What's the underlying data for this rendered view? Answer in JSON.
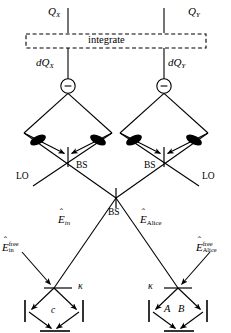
{
  "figure": {
    "background_color": "#ffffff",
    "line_color": "#000000",
    "width": 231,
    "height": 333
  },
  "top": {
    "charge_x": "Q",
    "charge_x_sub": "X",
    "charge_y": "Q",
    "charge_y_sub": "Y",
    "integrate_label": "integrate",
    "dq_x": "dQ",
    "dq_x_sub": "X",
    "dq_y": "dQ",
    "dq_y_sub": "Y",
    "subtractor_symbol": "−"
  },
  "detectors": {
    "left": {
      "name": "left-balanced-detector",
      "photodiode_count": 2
    },
    "right": {
      "name": "right-balanced-detector",
      "photodiode_count": 2
    }
  },
  "beamsplitters": {
    "left_bs_label": "BS",
    "right_bs_label": "BS",
    "center_bs_label": "BS",
    "left_lo_label": "LO",
    "right_lo_label": "LO"
  },
  "fields": {
    "e_in": "E",
    "e_in_sub": "in",
    "e_alice": "E",
    "e_alice_sub": "Alice",
    "e_in_free_sym": "E",
    "e_in_free_sup": "free",
    "e_in_free_sub": "in",
    "e_alice_free_sym": "E",
    "e_alice_free_sup": "free",
    "e_alice_free_sub": "Alice"
  },
  "cavities": {
    "left": {
      "coupling_label": "κ",
      "mode_label": "c",
      "mirror_count": 3
    },
    "right": {
      "coupling_label": "κ",
      "mode_label_a": "A",
      "mode_label_b": "B",
      "mirror_count": 3
    }
  }
}
